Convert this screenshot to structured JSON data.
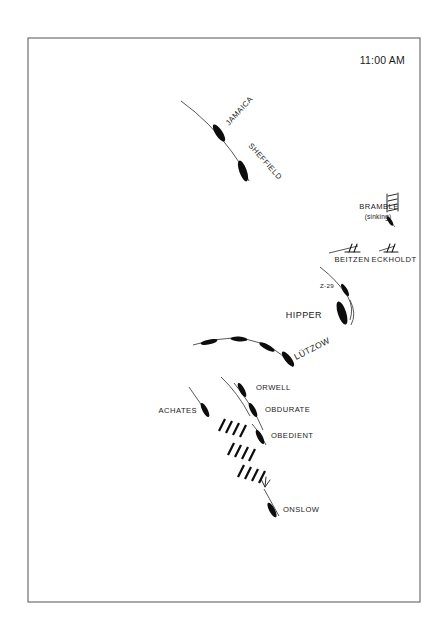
{
  "map": {
    "title_time": "11:00 AM",
    "frame": {
      "x": 28,
      "y": 38,
      "width": 392,
      "height": 564
    },
    "background_color": "#ffffff",
    "ink_color": "#0d0d0d",
    "track_color": "#3a3a3a"
  },
  "units": [
    {
      "id": "jamaica",
      "label": "JAMAICA",
      "label_x": 232,
      "label_y": 128,
      "label_rotate": -47,
      "hull": {
        "cx": 219,
        "cy": 133,
        "rx": 9.5,
        "ry": 3.4,
        "rotate": 57
      },
      "force": "british",
      "type": "cruiser"
    },
    {
      "id": "sheffield",
      "label": "SHEFFIELD",
      "label_x": 252,
      "label_y": 152,
      "label_rotate": 47,
      "hull": {
        "cx": 243,
        "cy": 171,
        "rx": 10.5,
        "ry": 3.6,
        "rotate": 70
      },
      "force": "british",
      "type": "cruiser"
    },
    {
      "id": "bramble",
      "label": "BRAMBLE",
      "sub_label": "(sinking)",
      "label_x": 378,
      "label_y": 209,
      "sub_label_x": 377,
      "sub_label_y": 219,
      "hull": {
        "cx": 390,
        "cy": 221,
        "rx": 5.2,
        "ry": 1.7,
        "rotate": 58
      },
      "force": "british",
      "type": "minesweeper",
      "status": "sinking"
    },
    {
      "id": "beitzen",
      "label": "BEITZEN",
      "label_x": 354,
      "label_y": 261,
      "hull": {
        "cx": 352,
        "cy": 249,
        "rx": 0,
        "ry": 0,
        "rotate": 0
      },
      "force": "german",
      "type": "destroyer"
    },
    {
      "id": "eckholdt",
      "label": "ECKHOLDT",
      "label_x": 394,
      "label_y": 261,
      "hull": {
        "cx": 391,
        "cy": 249,
        "rx": 0,
        "ry": 0,
        "rotate": 0
      },
      "force": "german",
      "type": "destroyer"
    },
    {
      "id": "z29",
      "label": "Z-29",
      "label_x": 327,
      "label_y": 287,
      "hull": {
        "cx": 344,
        "cy": 289,
        "rx": 6.6,
        "ry": 2.2,
        "rotate": 60
      },
      "force": "german",
      "type": "destroyer"
    },
    {
      "id": "hipper",
      "label": "HIPPER",
      "label_x": 296,
      "label_y": 317,
      "hull": {
        "cx": 341,
        "cy": 312,
        "rx": 11.5,
        "ry": 4.0,
        "rotate": 72
      },
      "force": "german",
      "type": "heavy-cruiser"
    },
    {
      "id": "lutzow",
      "label": "LÜTZOW",
      "label_x": 296,
      "label_y": 350,
      "label_rotate": -25,
      "hull": {
        "cx": 285,
        "cy": 354,
        "rx": 9.0,
        "ry": 3.2,
        "rotate": 58
      },
      "force": "german",
      "type": "pocket-battleship"
    },
    {
      "id": "orwell",
      "label": "ORWELL",
      "label_x": 260,
      "label_y": 390,
      "hull": {
        "cx": 243,
        "cy": 390,
        "rx": 7.5,
        "ry": 2.6,
        "rotate": 62
      },
      "force": "british",
      "type": "destroyer"
    },
    {
      "id": "obdurate",
      "label": "OBDURATE",
      "label_x": 266,
      "label_y": 411,
      "hull": {
        "cx": 252,
        "cy": 409,
        "rx": 7.5,
        "ry": 2.6,
        "rotate": 62
      },
      "force": "british",
      "type": "destroyer"
    },
    {
      "id": "achates",
      "label": "ACHATES",
      "label_x": 165,
      "label_y": 413,
      "hull": {
        "cx": 204,
        "cy": 409,
        "rx": 7.5,
        "ry": 2.6,
        "rotate": 62
      },
      "force": "british",
      "type": "destroyer"
    },
    {
      "id": "obedient",
      "label": "OBEDIENT",
      "label_x": 269,
      "label_y": 437,
      "hull": {
        "cx": 259,
        "cy": 436,
        "rx": 7.5,
        "ry": 2.6,
        "rotate": 62
      },
      "force": "british",
      "type": "destroyer"
    },
    {
      "id": "onslow",
      "label": "ONSLOW",
      "label_x": 283,
      "label_y": 510,
      "hull": {
        "cx": 272,
        "cy": 509,
        "rx": 8.0,
        "ry": 2.7,
        "rotate": 62
      },
      "force": "british",
      "type": "destroyer"
    }
  ],
  "lutzow_track_marks": [
    {
      "cx": 208,
      "cy": 342,
      "rx": 8.5,
      "ry": 2.4,
      "rotate": 16
    },
    {
      "cx": 237,
      "cy": 340,
      "rx": 8.5,
      "ry": 2.4,
      "rotate": 6
    },
    {
      "cx": 266,
      "cy": 346,
      "rx": 8.5,
      "ry": 2.6,
      "rotate": 32
    }
  ],
  "smoke_screen": {
    "label": "smoke-screen",
    "groups": [
      {
        "x": 222,
        "y": 430,
        "dashes": 4
      },
      {
        "x": 235,
        "y": 452,
        "dashes": 4
      },
      {
        "x": 245,
        "y": 473,
        "dashes": 4
      }
    ],
    "dash_angle_deg": 72,
    "dash_length": 13,
    "dash_gap": 7
  },
  "tracks": [
    {
      "id": "jamaica-sheffield-track",
      "d": "M 181 101 Q 210 122 232 152 Q 243 166 249 181"
    },
    {
      "id": "bramble-track",
      "d": "M 387 217 L 394 226"
    },
    {
      "id": "beitzen-track",
      "d": "M 330 252 L 357 246"
    },
    {
      "id": "eckholdt-track",
      "d": "M 378 251 L 394 246"
    },
    {
      "id": "z29-track",
      "d": "M 322 269 Q 338 281 347 296 Q 353 307 350 318"
    },
    {
      "id": "hipper-track",
      "d": "M 349 303 Q 355 315 350 324"
    },
    {
      "id": "lutzow-track",
      "d": "M 193 344 Q 230 333 262 344 Q 282 352 292 366"
    },
    {
      "id": "orwell-track",
      "d": "M 221 377 Q 238 392 250 414"
    },
    {
      "id": "obdurate-track",
      "d": "M 236 386 Q 252 405 262 428"
    },
    {
      "id": "achates-track",
      "d": "M 190 388 L 209 415"
    },
    {
      "id": "obedient-track",
      "d": "M 251 423 Q 260 432 266 444"
    },
    {
      "id": "onslow-track",
      "d": "M 264 489 L 279 515"
    }
  ],
  "arrows": [
    {
      "id": "onslow-approach-arrow",
      "x": 265,
      "y": 486,
      "rotate": 110
    }
  ]
}
